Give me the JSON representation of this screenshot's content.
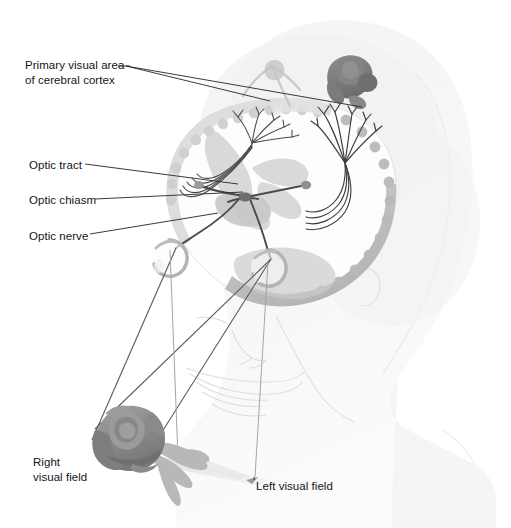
{
  "figure": {
    "background_color": "#ffffff"
  },
  "labels": {
    "primary_visual_area": "Primary visual area\nof cerebral cortex",
    "optic_tract": "Optic tract",
    "optic_chiasm": "Optic chiasm",
    "optic_nerve": "Optic nerve",
    "right_visual_field": "Right\nvisual field",
    "left_visual_field": "Left visual field"
  },
  "colors": {
    "text": "#141414",
    "leader_line": "#3b3b3b",
    "nerve_path": "#4a4a4a",
    "sight_line": "#575757",
    "field_ray": "#9e9e9e",
    "head_silhouette": "#f2f2f2",
    "head_shadow": "#e8e8e8",
    "face_outline": "#dcdcdc",
    "brain_fill": "#fafafa",
    "brain_cortex": "#bfbfbf",
    "brain_cortex_light": "#d8d8d8",
    "brain_inner": "#cfcfcf",
    "rose_body": "#8e8e8e",
    "rose_dark": "#757575",
    "rose_light": "#a8a8a8",
    "rose_leaf": "#b4b4b4",
    "cortex_image_rose": "#7a7a7a",
    "eye_outline": "#b0b0b0",
    "shadow_plane": "#e0e0e0"
  },
  "anatomy": {
    "structures": [
      "head silhouette",
      "face outline",
      "cerebral hemispheres",
      "cerebral cortex ribbon",
      "left eye",
      "right eye",
      "optic nerve left",
      "optic nerve right",
      "optic chiasm",
      "optic tract left",
      "optic tract right",
      "optic radiation left",
      "optic radiation right",
      "rose object",
      "inverted cortical image of rose"
    ]
  }
}
